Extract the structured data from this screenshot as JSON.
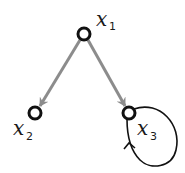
{
  "diagram": {
    "type": "directed-graph",
    "colors": {
      "node_stroke": "#111111",
      "edge": "#8c8c8c",
      "loop": "#111111",
      "background": "#ffffff"
    },
    "nodes": [
      {
        "id": "x1",
        "label": "x",
        "subscript": "1",
        "cx": 84,
        "cy": 34
      },
      {
        "id": "x2",
        "label": "x",
        "subscript": "2",
        "cx": 35,
        "cy": 113
      },
      {
        "id": "x3",
        "label": "x",
        "subscript": "3",
        "cx": 129,
        "cy": 113
      }
    ],
    "edges": [
      {
        "from": "x1",
        "to": "x2",
        "style": "gray-arrow"
      },
      {
        "from": "x1",
        "to": "x3",
        "style": "gray-arrow"
      },
      {
        "from": "x3",
        "to": "x3",
        "style": "self-loop"
      }
    ]
  }
}
